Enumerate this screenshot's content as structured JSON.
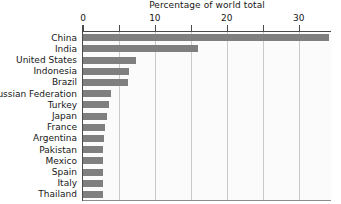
{
  "chart_data": {
    "type": "bar",
    "orientation": "horizontal",
    "title": "Percentage of world total",
    "xlabel": "",
    "ylabel": "",
    "xlim": [
      0,
      34.5
    ],
    "xticks": [
      0,
      10,
      20,
      30
    ],
    "xtick_labels": [
      "0",
      "10",
      "20",
      "30"
    ],
    "minor_tick_step": 5,
    "grid": true,
    "grid_axis": "x",
    "legend": null,
    "bar_color": "#7f7f7f",
    "plot_background": "#fbfbfb",
    "axis_color": "#4a4a4a",
    "gridline_color": "#c9c9c9",
    "categories": [
      "China",
      "India",
      "United States",
      "Indonesia",
      "Brazil",
      "Russian Federation",
      "Turkey",
      "Japan",
      "France",
      "Argentina",
      "Pakistan",
      "Mexico",
      "Spain",
      "Italy",
      "Thailand"
    ],
    "values": [
      34.2,
      16.0,
      7.4,
      6.4,
      6.3,
      3.9,
      3.6,
      3.3,
      3.0,
      2.9,
      2.8,
      2.8,
      2.8,
      2.8,
      2.8
    ]
  }
}
